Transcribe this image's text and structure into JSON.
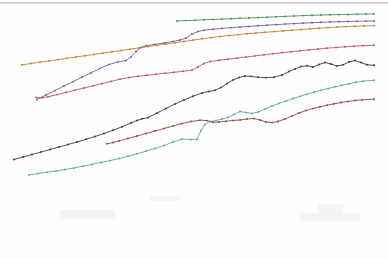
{
  "page": {
    "background_color": "#fefefe",
    "scan_edge_color": "#9a9a9a"
  },
  "chart_data": {
    "type": "line",
    "title": "",
    "subtitle": "",
    "xlabel": "",
    "ylabel": "",
    "xlim": [
      0,
      388
    ],
    "ylim": [
      0,
      259
    ],
    "grid": false,
    "legend": "none",
    "axes_visible": false,
    "tick_labels_x": [],
    "tick_labels_y": [],
    "annotations": [],
    "note": "Faded photocopy/scan of a multi-series monotone growth chart; axes and labels are not legible in the image. Coordinates below are pixel positions (y increases downward) traced from the scan.",
    "series": [
      {
        "name": "green",
        "color": "#4a8f5e",
        "marker": "dot",
        "points": [
          [
            177,
            21.0
          ],
          [
            186,
            20.6
          ],
          [
            195,
            20.2
          ],
          [
            204,
            19.8
          ],
          [
            213,
            19.4
          ],
          [
            222,
            19.1
          ],
          [
            231,
            18.7
          ],
          [
            240,
            18.3
          ],
          [
            249,
            18.0
          ],
          [
            258,
            17.6
          ],
          [
            267,
            17.2
          ],
          [
            276,
            16.8
          ],
          [
            285,
            16.4
          ],
          [
            294,
            16.0
          ],
          [
            303,
            15.6
          ],
          [
            312,
            15.3
          ],
          [
            321,
            15.0
          ],
          [
            330,
            14.8
          ],
          [
            339,
            14.6
          ],
          [
            348,
            14.4
          ],
          [
            357,
            14.2
          ],
          [
            366,
            14.0
          ],
          [
            374,
            13.9
          ]
        ]
      },
      {
        "name": "purple",
        "color": "#7a5aa8",
        "marker": "dot",
        "points": [
          [
            37,
            99.5
          ],
          [
            46,
            95.0
          ],
          [
            55,
            90.5
          ],
          [
            64,
            86.0
          ],
          [
            73,
            81.6
          ],
          [
            82,
            77.2
          ],
          [
            91,
            72.8
          ],
          [
            100,
            68.4
          ],
          [
            109,
            64.5
          ],
          [
            118,
            62.0
          ],
          [
            126,
            60.5
          ],
          [
            131,
            57.0
          ],
          [
            136,
            51.5
          ],
          [
            141,
            47.5
          ],
          [
            146,
            45.8
          ],
          [
            155,
            44.4
          ],
          [
            164,
            43.0
          ],
          [
            173,
            41.5
          ],
          [
            180,
            40.0
          ],
          [
            186,
            38.2
          ],
          [
            192,
            34.0
          ],
          [
            198,
            31.5
          ],
          [
            204,
            30.2
          ],
          [
            213,
            29.2
          ],
          [
            222,
            28.4
          ],
          [
            231,
            27.6
          ],
          [
            240,
            27.0
          ],
          [
            249,
            26.4
          ],
          [
            258,
            25.8
          ],
          [
            267,
            25.2
          ],
          [
            276,
            24.6
          ],
          [
            285,
            24.1
          ],
          [
            294,
            23.6
          ],
          [
            303,
            23.1
          ],
          [
            312,
            22.7
          ],
          [
            321,
            22.3
          ],
          [
            330,
            22.0
          ],
          [
            339,
            21.7
          ],
          [
            348,
            21.5
          ],
          [
            357,
            21.3
          ],
          [
            366,
            21.1
          ],
          [
            374,
            21.0
          ]
        ]
      },
      {
        "name": "orange",
        "color": "#c2802f",
        "marker": "dot",
        "points": [
          [
            22,
            64.8
          ],
          [
            31,
            63.5
          ],
          [
            40,
            62.2
          ],
          [
            49,
            60.9
          ],
          [
            58,
            59.6
          ],
          [
            67,
            58.3
          ],
          [
            76,
            57.0
          ],
          [
            85,
            55.7
          ],
          [
            94,
            54.4
          ],
          [
            103,
            53.1
          ],
          [
            112,
            51.8
          ],
          [
            121,
            50.5
          ],
          [
            130,
            49.2
          ],
          [
            139,
            47.9
          ],
          [
            148,
            46.6
          ],
          [
            157,
            45.3
          ],
          [
            166,
            44.0
          ],
          [
            175,
            42.7
          ],
          [
            184,
            41.4
          ],
          [
            193,
            40.1
          ],
          [
            202,
            38.8
          ],
          [
            211,
            37.6
          ],
          [
            220,
            36.5
          ],
          [
            229,
            35.5
          ],
          [
            238,
            34.6
          ],
          [
            247,
            33.8
          ],
          [
            256,
            33.0
          ],
          [
            265,
            32.3
          ],
          [
            274,
            31.6
          ],
          [
            283,
            30.9
          ],
          [
            292,
            30.2
          ],
          [
            301,
            29.5
          ],
          [
            310,
            28.8
          ],
          [
            319,
            28.2
          ],
          [
            328,
            27.6
          ],
          [
            337,
            27.1
          ],
          [
            346,
            26.6
          ],
          [
            355,
            26.2
          ],
          [
            364,
            25.9
          ],
          [
            374,
            25.6
          ]
        ]
      },
      {
        "name": "red",
        "color": "#c2506a",
        "marker": "dot",
        "points": [
          [
            36,
            97.5
          ],
          [
            42,
            97.8
          ],
          [
            48,
            96.8
          ],
          [
            57,
            94.6
          ],
          [
            66,
            92.4
          ],
          [
            75,
            90.2
          ],
          [
            84,
            88.0
          ],
          [
            93,
            85.8
          ],
          [
            102,
            83.6
          ],
          [
            111,
            81.4
          ],
          [
            120,
            79.2
          ],
          [
            129,
            77.5
          ],
          [
            138,
            76.3
          ],
          [
            147,
            75.3
          ],
          [
            156,
            74.3
          ],
          [
            165,
            73.3
          ],
          [
            174,
            72.3
          ],
          [
            183,
            71.3
          ],
          [
            192,
            70.0
          ],
          [
            198,
            67.0
          ],
          [
            204,
            63.5
          ],
          [
            210,
            61.5
          ],
          [
            219,
            60.3
          ],
          [
            228,
            59.2
          ],
          [
            237,
            58.1
          ],
          [
            246,
            57.0
          ],
          [
            255,
            55.9
          ],
          [
            264,
            54.8
          ],
          [
            273,
            53.7
          ],
          [
            282,
            52.7
          ],
          [
            291,
            51.7
          ],
          [
            300,
            50.8
          ],
          [
            309,
            49.9
          ],
          [
            318,
            49.0
          ],
          [
            327,
            48.2
          ],
          [
            336,
            47.5
          ],
          [
            345,
            46.8
          ],
          [
            354,
            46.2
          ],
          [
            363,
            45.7
          ],
          [
            374,
            45.3
          ]
        ]
      },
      {
        "name": "navy",
        "color": "#2e3a52",
        "marker": "dot",
        "points": [
          [
            14,
            159.5
          ],
          [
            23,
            157.0
          ],
          [
            32,
            154.5
          ],
          [
            41,
            152.0
          ],
          [
            50,
            149.5
          ],
          [
            59,
            147.0
          ],
          [
            68,
            144.5
          ],
          [
            77,
            142.0
          ],
          [
            86,
            139.3
          ],
          [
            95,
            136.5
          ],
          [
            104,
            133.5
          ],
          [
            113,
            130.3
          ],
          [
            122,
            126.8
          ],
          [
            131,
            123.0
          ],
          [
            137,
            120.5
          ],
          [
            142,
            118.8
          ],
          [
            148,
            117.6
          ],
          [
            157,
            113.0
          ],
          [
            166,
            108.5
          ],
          [
            175,
            104.0
          ],
          [
            184,
            100.0
          ],
          [
            193,
            96.2
          ],
          [
            202,
            93.0
          ],
          [
            209,
            91.5
          ],
          [
            215,
            90.2
          ],
          [
            221,
            87.5
          ],
          [
            227,
            83.5
          ],
          [
            233,
            80.0
          ],
          [
            239,
            77.5
          ],
          [
            245,
            76.0
          ],
          [
            251,
            76.4
          ],
          [
            258,
            77.3
          ],
          [
            266,
            77.6
          ],
          [
            274,
            77.2
          ],
          [
            282,
            75.0
          ],
          [
            289,
            71.5
          ],
          [
            295,
            69.0
          ],
          [
            301,
            66.5
          ],
          [
            307,
            65.8
          ],
          [
            313,
            67.0
          ],
          [
            319,
            64.5
          ],
          [
            325,
            62.5
          ],
          [
            331,
            64.0
          ],
          [
            337,
            66.0
          ],
          [
            343,
            64.8
          ],
          [
            349,
            62.0
          ],
          [
            355,
            60.5
          ],
          [
            361,
            62.5
          ],
          [
            367,
            64.8
          ],
          [
            374,
            65.3
          ]
        ]
      },
      {
        "name": "cyan",
        "color": "#5aa8a8",
        "marker": "dot",
        "points": [
          [
            29,
            175.0
          ],
          [
            38,
            173.5
          ],
          [
            47,
            172.2
          ],
          [
            56,
            171.0
          ],
          [
            65,
            169.5
          ],
          [
            74,
            168.0
          ],
          [
            83,
            166.2
          ],
          [
            92,
            164.4
          ],
          [
            101,
            162.5
          ],
          [
            110,
            160.6
          ],
          [
            119,
            158.5
          ],
          [
            128,
            156.2
          ],
          [
            137,
            153.8
          ],
          [
            146,
            151.2
          ],
          [
            155,
            148.5
          ],
          [
            164,
            145.5
          ],
          [
            173,
            142.0
          ],
          [
            182,
            139.0
          ],
          [
            191,
            139.5
          ],
          [
            197,
            139.2
          ],
          [
            201,
            130.5
          ],
          [
            205,
            124.5
          ],
          [
            210,
            121.5
          ],
          [
            216,
            120.5
          ],
          [
            222,
            119.0
          ],
          [
            228,
            117.5
          ],
          [
            234,
            114.5
          ],
          [
            240,
            111.5
          ],
          [
            246,
            112.5
          ],
          [
            252,
            113.5
          ],
          [
            258,
            112.0
          ],
          [
            265,
            109.0
          ],
          [
            272,
            106.0
          ],
          [
            279,
            103.5
          ],
          [
            286,
            101.0
          ],
          [
            293,
            98.5
          ],
          [
            300,
            96.3
          ],
          [
            307,
            94.2
          ],
          [
            314,
            92.2
          ],
          [
            321,
            90.3
          ],
          [
            328,
            88.5
          ],
          [
            335,
            86.8
          ],
          [
            342,
            85.2
          ],
          [
            349,
            83.7
          ],
          [
            356,
            82.3
          ],
          [
            363,
            81.2
          ],
          [
            374,
            80.3
          ]
        ]
      },
      {
        "name": "maroon",
        "color": "#8c4a42",
        "marker": "dot",
        "points": [
          [
            107,
            143.8
          ],
          [
            113,
            142.5
          ],
          [
            119,
            141.0
          ],
          [
            128,
            138.5
          ],
          [
            137,
            136.0
          ],
          [
            146,
            133.5
          ],
          [
            155,
            131.0
          ],
          [
            164,
            128.5
          ],
          [
            173,
            126.0
          ],
          [
            182,
            123.5
          ],
          [
            191,
            121.5
          ],
          [
            200,
            120.2
          ],
          [
            207,
            120.6
          ],
          [
            213,
            122.3
          ],
          [
            219,
            122.0
          ],
          [
            226,
            121.2
          ],
          [
            233,
            120.5
          ],
          [
            240,
            120.0
          ],
          [
            247,
            119.0
          ],
          [
            254,
            118.5
          ],
          [
            260,
            120.0
          ],
          [
            266,
            122.0
          ],
          [
            272,
            122.5
          ],
          [
            278,
            121.5
          ],
          [
            285,
            119.0
          ],
          [
            292,
            116.0
          ],
          [
            299,
            113.0
          ],
          [
            306,
            110.5
          ],
          [
            313,
            108.5
          ],
          [
            320,
            106.8
          ],
          [
            327,
            105.2
          ],
          [
            334,
            103.8
          ],
          [
            341,
            102.5
          ],
          [
            348,
            101.4
          ],
          [
            355,
            100.5
          ],
          [
            362,
            99.8
          ],
          [
            374,
            99.2
          ]
        ]
      }
    ]
  }
}
